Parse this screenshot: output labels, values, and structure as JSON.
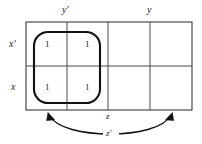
{
  "figure": {
    "kind": "karnaugh-map",
    "background_color": "#ffffff",
    "line_color": "#333333",
    "group_color": "#111111",
    "arrow_color": "#111111"
  },
  "column_labels": [
    {
      "name": "y-prime",
      "text": "y′",
      "x": 67,
      "y": 11
    },
    {
      "name": "y",
      "text": "y",
      "x": 150,
      "y": 11
    }
  ],
  "row_labels": [
    {
      "name": "x-prime",
      "text": "x′",
      "x": 14,
      "y": 45
    },
    {
      "name": "x",
      "text": "x",
      "x": 15,
      "y": 88
    }
  ],
  "bottom_labels": [
    {
      "name": "z",
      "text": "z",
      "x": 109,
      "y": 117
    },
    {
      "name": "z-prime",
      "text": "z′",
      "x": 110,
      "y": 134
    }
  ],
  "grid": {
    "left": 26,
    "top": 22,
    "right": 192,
    "bottom": 110,
    "columns": 4,
    "rows": 2,
    "v_dividers": [
      67,
      108,
      150
    ],
    "h_dividers": [
      66
    ]
  },
  "cells": [
    {
      "name": "cell-r0-c0",
      "row": 0,
      "col": 0,
      "value": "1",
      "x": 48,
      "y": 45
    },
    {
      "name": "cell-r0-c1",
      "row": 0,
      "col": 1,
      "value": "1",
      "x": 88,
      "y": 45
    },
    {
      "name": "cell-r0-c2",
      "row": 0,
      "col": 2,
      "value": "",
      "x": 129,
      "y": 45
    },
    {
      "name": "cell-r0-c3",
      "row": 0,
      "col": 3,
      "value": "",
      "x": 171,
      "y": 45
    },
    {
      "name": "cell-r1-c0",
      "row": 1,
      "col": 0,
      "value": "1",
      "x": 48,
      "y": 88
    },
    {
      "name": "cell-r1-c1",
      "row": 1,
      "col": 1,
      "value": "1",
      "x": 88,
      "y": 88
    },
    {
      "name": "cell-r1-c2",
      "row": 1,
      "col": 2,
      "value": "",
      "x": 129,
      "y": 88
    },
    {
      "name": "cell-r1-c3",
      "row": 1,
      "col": 3,
      "value": "",
      "x": 171,
      "y": 88
    }
  ],
  "group_loop": {
    "name": "group-loop-z-prime",
    "x": 34,
    "y": 32,
    "width": 66,
    "height": 71,
    "corner_radius": 14
  },
  "bracket_arrow": {
    "name": "z-prime-span-arrow",
    "left_tip_x": 48,
    "left_tip_y": 113,
    "right_tip_x": 172,
    "right_tip_y": 113,
    "dip_y": 139
  }
}
